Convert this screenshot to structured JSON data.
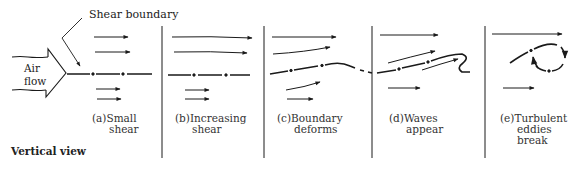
{
  "figure": {
    "annotations": {
      "shear_boundary": "Shear boundary",
      "air_flow_line1": "Air",
      "air_flow_line2": "flow",
      "view_label": "Vertical view"
    },
    "panels": [
      {
        "id": "a",
        "prefix": "(a)",
        "line1": "Small",
        "line2": "shear",
        "line3": ""
      },
      {
        "id": "b",
        "prefix": "(b)",
        "line1": "Increasing",
        "line2": "shear",
        "line3": ""
      },
      {
        "id": "c",
        "prefix": "(c)",
        "line1": "Boundary",
        "line2": "deforms",
        "line3": ""
      },
      {
        "id": "d",
        "prefix": "(d)",
        "line1": "Waves",
        "line2": "appear",
        "line3": ""
      },
      {
        "id": "e",
        "prefix": "(e)",
        "line1": "Turbulent",
        "line2": "eddies",
        "line3": "break"
      }
    ],
    "colors": {
      "ink": "#1a1a1a",
      "background": "#ffffff"
    }
  }
}
